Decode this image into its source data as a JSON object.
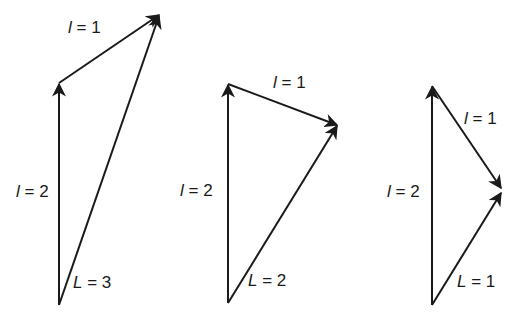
{
  "colors": {
    "line": "#1a1a1a",
    "background": "#ffffff"
  },
  "diagrams": [
    {
      "id": "L3",
      "labels": {
        "l2": {
          "sym": "l",
          "eq": " = 2"
        },
        "l1": {
          "sym": "l",
          "eq": " = 1"
        },
        "L": {
          "sym": "L",
          "eq": " = 3"
        }
      },
      "points": {
        "base": [
          59,
          305
        ],
        "mid": [
          59,
          83
        ],
        "tip": [
          160,
          14
        ]
      }
    },
    {
      "id": "L2",
      "labels": {
        "l2": {
          "sym": "l",
          "eq": " = 2"
        },
        "l1": {
          "sym": "l",
          "eq": " = 1"
        },
        "L": {
          "sym": "L",
          "eq": " = 2"
        }
      },
      "points": {
        "base": [
          228,
          303
        ],
        "mid": [
          228,
          84
        ],
        "tip": [
          338,
          125
        ]
      }
    },
    {
      "id": "L1",
      "labels": {
        "l2": {
          "sym": "l",
          "eq": " = 2"
        },
        "l1": {
          "sym": "l",
          "eq": " = 1"
        },
        "L": {
          "sym": "L",
          "eq": " = 1"
        }
      },
      "points": {
        "base": [
          432,
          305
        ],
        "mid": [
          432,
          86
        ],
        "tip": [
          502,
          190
        ]
      }
    }
  ]
}
